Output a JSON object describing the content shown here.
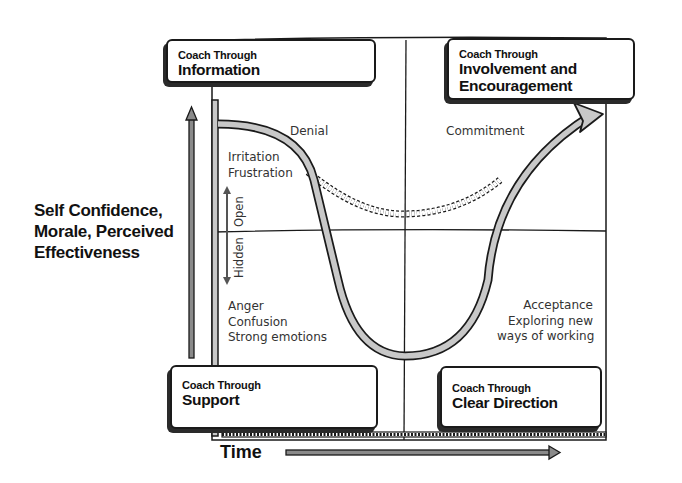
{
  "diagram": {
    "y_axis_label": "Self Confidence,\nMorale, Perceived\nEffectiveness",
    "x_axis_label": "Time",
    "quadrants": {
      "top_left": {
        "subtitle": "Coach Through",
        "title": "Information"
      },
      "top_right": {
        "subtitle": "Coach Through",
        "title": "Involvement and\nEncouragement"
      },
      "bottom_left": {
        "subtitle": "Coach Through",
        "title": "Support"
      },
      "bottom_right": {
        "subtitle": "Coach Through",
        "title": "Clear Direction"
      }
    },
    "curve_labels": {
      "denial": "Denial",
      "irritation": "Irritation\nFrustration",
      "anger": "Anger\nConfusion\nStrong emotions",
      "acceptance": "Acceptance\nExploring new\nways of working",
      "commitment": "Commitment"
    },
    "visibility_axis": {
      "open": "Open",
      "hidden": "Hidden"
    },
    "colors": {
      "ink": "#1a1a1a",
      "curve_fill": "#c8c8c8",
      "arrow_fill": "#8a8a8a",
      "text": "#333333"
    }
  }
}
